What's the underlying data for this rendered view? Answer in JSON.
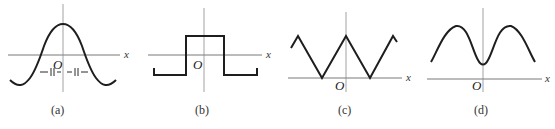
{
  "panels": [
    {
      "id": "a",
      "caption": "(a)",
      "axis_label": "x",
      "origin_label": "O",
      "shape": "cosine-like pulse with negative side lobes",
      "annotation": "—||— —||—"
    },
    {
      "id": "b",
      "caption": "(b)",
      "axis_label": "x",
      "origin_label": "O",
      "shape": "rectangular pulse"
    },
    {
      "id": "c",
      "caption": "(c)",
      "axis_label": "x",
      "origin_label": "O",
      "shape": "triangular wave"
    },
    {
      "id": "d",
      "caption": "(d)",
      "axis_label": "x",
      "origin_label": "O",
      "shape": "double-humped smooth wave"
    }
  ],
  "colors": {
    "curve": "#1e1e1e",
    "axis": "#6a6a6a",
    "background": "#ffffff"
  }
}
